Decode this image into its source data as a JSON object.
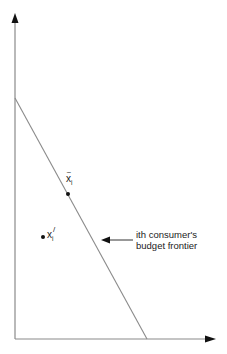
{
  "diagram": {
    "colors": {
      "axis": "#8a8a8a",
      "line": "#8a8a8a",
      "arrowhead": "#111111",
      "point": "#111111",
      "text": "#222222"
    },
    "axes": {
      "origin": [
        15,
        339
      ],
      "y_axis_top": [
        15,
        14
      ],
      "x_axis_right": [
        215,
        339
      ]
    },
    "budget_line": {
      "start": [
        15,
        98
      ],
      "end": [
        147,
        339
      ]
    },
    "points": [
      {
        "id": "x-tilde-i",
        "base": "x",
        "accent": "~",
        "subscript": "i",
        "superscript": "",
        "position": [
          68,
          194
        ],
        "on_budget_line": true
      },
      {
        "id": "x-prime-i",
        "base": "x",
        "accent": "",
        "subscript": "i",
        "superscript": "/",
        "position": [
          43,
          237
        ],
        "on_budget_line": false
      }
    ],
    "annotation": {
      "line1": "ith consumer's",
      "line2": "budget frontier",
      "arrow_from": [
        133,
        240
      ],
      "arrow_to": [
        101,
        240
      ]
    }
  }
}
